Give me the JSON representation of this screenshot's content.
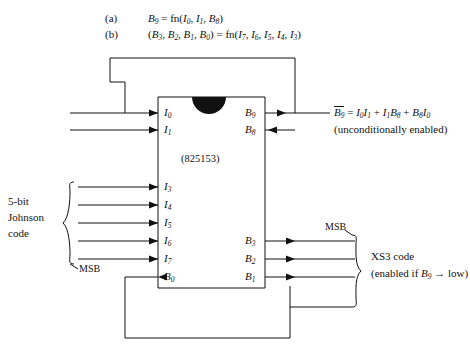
{
  "equations": {
    "a": {
      "marker": "(a)",
      "text": "B9 = fn(I0, I1, B8)"
    },
    "b": {
      "marker": "(b)",
      "text": "(B3, B2, B1, B0) = fn(I7, I6, I5, I4, I3)"
    }
  },
  "chip": {
    "part_number": "(825153)",
    "notch": "pin1-notch",
    "left_pins": [
      "I0",
      "I1",
      "I3",
      "I4",
      "I5",
      "I6",
      "I7",
      "B0"
    ],
    "right_pins": [
      "B9",
      "B8",
      "B3",
      "B2",
      "B1"
    ]
  },
  "annotations": {
    "output_eq": "B9 = I0I1 + I1B8 + B8I0",
    "output_eq_note": "(unconditionally enabled)",
    "input_group_label_line1": "5-bit",
    "input_group_label_line2": "Johnson",
    "input_group_label_line3": "code",
    "input_msb": "MSB",
    "output_msb": "MSB",
    "output_group_label": "XS3 code",
    "output_group_note": "(enabled if B9 → low)"
  },
  "colors": {
    "ink": "#111111",
    "background": "#ffffff"
  }
}
